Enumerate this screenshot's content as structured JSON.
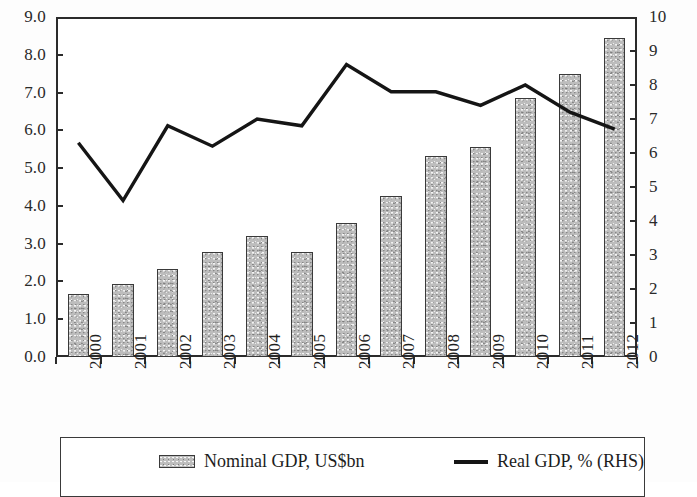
{
  "chart_data": {
    "type": "bar",
    "title": "",
    "subtitle": "",
    "xlabel": "",
    "ylabel": "",
    "y2label": "",
    "grid": false,
    "legend_position": "bottom",
    "categories": [
      "2000",
      "2001",
      "2002",
      "2003",
      "2004",
      "2005",
      "2006",
      "2007",
      "2008",
      "2009",
      "2010",
      "2011",
      "2012"
    ],
    "ylim": [
      0.0,
      9.0
    ],
    "y2lim": [
      0,
      10
    ],
    "yticks": [
      "0.0",
      "1.0",
      "2.0",
      "3.0",
      "4.0",
      "5.0",
      "6.0",
      "7.0",
      "8.0",
      "9.0"
    ],
    "y2ticks": [
      "0",
      "1",
      "2",
      "3",
      "4",
      "5",
      "6",
      "7",
      "8",
      "9",
      "10"
    ],
    "series": [
      {
        "name": "Nominal GDP, US$bn",
        "type": "bar",
        "axis": "left",
        "color": "#bdbdbd",
        "edge_color": "#3a3a3a",
        "values": [
          1.68,
          1.93,
          2.32,
          2.78,
          3.2,
          2.78,
          3.55,
          4.25,
          5.33,
          5.57,
          6.85,
          7.5,
          8.45
        ]
      },
      {
        "name": "Real GDP, % (RHS)",
        "type": "line",
        "axis": "right",
        "color": "#151515",
        "values": [
          6.3,
          4.6,
          6.8,
          6.2,
          7.0,
          6.8,
          8.6,
          7.8,
          7.8,
          7.4,
          8.0,
          7.2,
          6.7
        ]
      }
    ]
  },
  "legend": {
    "bar_label": "Nominal GDP, US$bn",
    "line_label": "Real GDP, % (RHS)"
  }
}
